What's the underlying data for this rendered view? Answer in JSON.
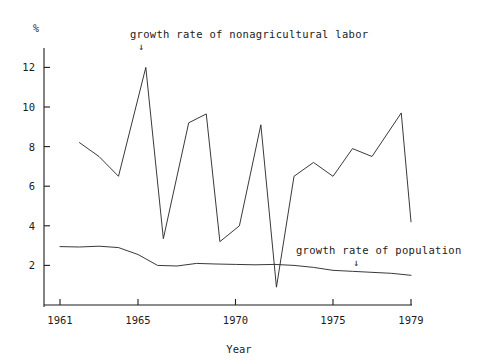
{
  "figure": {
    "background": "#ffffff",
    "ink": "#1d1d1d",
    "percent_symbol": "%",
    "xlabel": "Year",
    "annotations": [
      {
        "text": "growth rate of nonagricultural labor",
        "arrow": "↓",
        "series": "nonagricultural-labor"
      },
      {
        "text": "growth rate of population",
        "arrow": "↓",
        "series": "population"
      }
    ]
  },
  "chart_data": {
    "type": "line",
    "title": "",
    "subtitle": "",
    "xlabel": "Year",
    "ylabel": "%",
    "grid": false,
    "legend": "annotations-inline",
    "xlim": [
      1960.4,
      1979.6
    ],
    "ylim": [
      0,
      13.2
    ],
    "xticks": [
      1961,
      1965,
      1970,
      1975,
      1979
    ],
    "xtick_labels": [
      "1961",
      "1965",
      "1970",
      "1975",
      "1979"
    ],
    "yticks": [
      2,
      4,
      6,
      8,
      10,
      12
    ],
    "ytick_labels": [
      "2",
      "4",
      "6",
      "8",
      "10",
      "12"
    ],
    "series": [
      {
        "name": "growth rate of nonagricultural labor",
        "color": "#222222",
        "x": [
          1962,
          1963,
          1964,
          1965.4,
          1966.3,
          1967.6,
          1968.5,
          1969.2,
          1970.2,
          1971.3,
          1972.1,
          1973,
          1974,
          1975,
          1976,
          1977,
          1978.5,
          1979
        ],
        "values": [
          8.2,
          7.5,
          6.5,
          12.0,
          3.35,
          9.2,
          9.65,
          3.2,
          4.0,
          9.1,
          0.9,
          6.5,
          7.2,
          6.5,
          7.9,
          7.5,
          9.7,
          4.2
        ]
      },
      {
        "name": "growth rate of population",
        "color": "#222222",
        "x": [
          1961,
          1962,
          1963,
          1964,
          1965,
          1966,
          1967,
          1968,
          1969,
          1970,
          1971,
          1972,
          1973,
          1974,
          1975,
          1976,
          1977,
          1978,
          1979
        ],
        "values": [
          2.95,
          2.93,
          2.97,
          2.9,
          2.55,
          2.0,
          1.97,
          2.1,
          2.07,
          2.05,
          2.03,
          2.05,
          2.0,
          1.9,
          1.75,
          1.7,
          1.65,
          1.6,
          1.5
        ]
      }
    ],
    "annotation_points": [
      {
        "label": "growth rate of nonagricultural labor",
        "x": 1965.4,
        "y": 12.9
      },
      {
        "label": "growth rate of population",
        "x": 1976.0,
        "y": 2.75
      }
    ]
  }
}
